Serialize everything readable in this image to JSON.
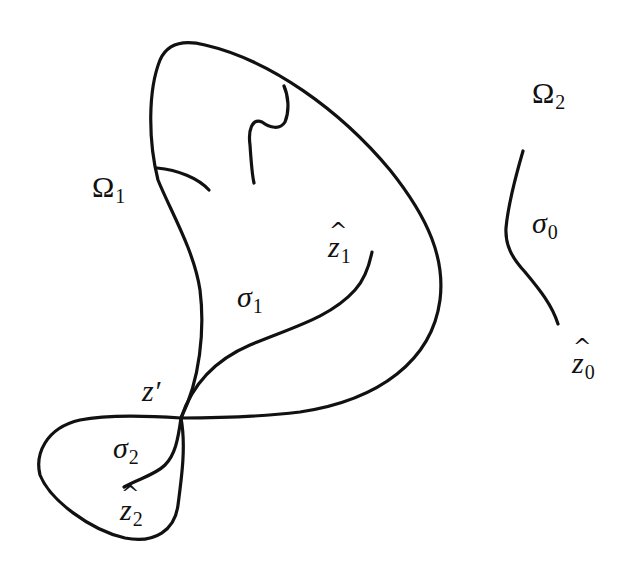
{
  "diagram": {
    "title": "",
    "regions": [
      {
        "id": "omega1",
        "symbol": "Ω",
        "subscript": "1"
      },
      {
        "id": "omega2",
        "symbol": "Ω",
        "subscript": "2"
      }
    ],
    "curves": [
      {
        "id": "sigma0",
        "symbol": "σ",
        "subscript": "0"
      },
      {
        "id": "sigma1",
        "symbol": "σ",
        "subscript": "1"
      },
      {
        "id": "sigma2",
        "symbol": "σ",
        "subscript": "2"
      }
    ],
    "points": [
      {
        "id": "zprime",
        "symbol": "z′"
      },
      {
        "id": "zhat0",
        "symbol": "z",
        "subscript": "0",
        "accent": "^"
      },
      {
        "id": "zhat1",
        "symbol": "z",
        "subscript": "1",
        "accent": "^"
      },
      {
        "id": "zhat2",
        "symbol": "z",
        "subscript": "2",
        "accent": "^"
      }
    ],
    "labels": {
      "omega1": {
        "main": "Ω",
        "sub": "1"
      },
      "omega2": {
        "main": "Ω",
        "sub": "2"
      },
      "sigma0": {
        "main": "σ",
        "sub": "0"
      },
      "sigma1": {
        "main": "σ",
        "sub": "1"
      },
      "sigma2": {
        "main": "σ",
        "sub": "2"
      },
      "zprime": {
        "main": "z′"
      },
      "zhat0": {
        "main": "z",
        "sub": "0",
        "accent": "^"
      },
      "zhat1": {
        "main": "z",
        "sub": "1",
        "accent": "^"
      },
      "zhat2": {
        "main": "z",
        "sub": "2",
        "accent": "^"
      }
    },
    "stroke_color": "#111111",
    "background_color": "#ffffff"
  }
}
